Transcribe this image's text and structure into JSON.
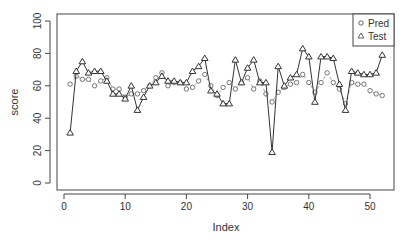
{
  "chart_data": {
    "type": "line",
    "title": "",
    "xlabel": "Index",
    "ylabel": "score",
    "xlim": [
      0,
      53
    ],
    "ylim": [
      0,
      100
    ],
    "x_ticks": [
      0,
      10,
      20,
      30,
      40,
      50
    ],
    "y_ticks": [
      0,
      20,
      40,
      60,
      80,
      100
    ],
    "grid": false,
    "legend_position": "top-right",
    "x": [
      1,
      2,
      3,
      4,
      5,
      6,
      7,
      8,
      9,
      10,
      11,
      12,
      13,
      14,
      15,
      16,
      17,
      18,
      19,
      20,
      21,
      22,
      23,
      24,
      25,
      26,
      27,
      28,
      29,
      30,
      31,
      32,
      33,
      34,
      35,
      36,
      37,
      38,
      39,
      40,
      41,
      42,
      43,
      44,
      45,
      46,
      47,
      48,
      49,
      50,
      51,
      52
    ],
    "series": [
      {
        "name": "Pred",
        "marker": "circle",
        "line": "dashed",
        "values": [
          61,
          66,
          64,
          64,
          60,
          63,
          65,
          58,
          58,
          53,
          55,
          55,
          57,
          60,
          65,
          68,
          60,
          62,
          62,
          58,
          59,
          63,
          67,
          60,
          54,
          59,
          62,
          58,
          62,
          65,
          58,
          63,
          55,
          50,
          56,
          59,
          61,
          62,
          67,
          62,
          56,
          62,
          68,
          62,
          58,
          49,
          62,
          61,
          61,
          57,
          55,
          54
        ]
      },
      {
        "name": "Test",
        "marker": "triangle",
        "line": "solid",
        "values": [
          31,
          69,
          75,
          68,
          69,
          69,
          63,
          55,
          55,
          52,
          60,
          45,
          53,
          60,
          62,
          66,
          63,
          63,
          62,
          62,
          69,
          72,
          77,
          57,
          55,
          49,
          49,
          76,
          62,
          71,
          76,
          62,
          62,
          19,
          72,
          60,
          65,
          67,
          83,
          78,
          50,
          78,
          78,
          77,
          61,
          45,
          69,
          68,
          67,
          67,
          68,
          79
        ]
      }
    ]
  },
  "labels": {
    "xlabel": "Index",
    "ylabel": "score",
    "legend_pred": "Pred",
    "legend_test": "Test"
  }
}
